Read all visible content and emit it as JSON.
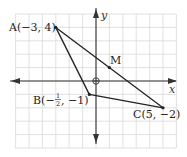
{
  "diagram": {
    "grid": {
      "xmin": -6,
      "xmax": 6,
      "ymin": -5,
      "ymax": 5,
      "unit_px": 13.4,
      "origin_px": [
        96,
        81
      ],
      "color": "#d9d9d9"
    },
    "axes": {
      "x_label": "x",
      "y_label": "y",
      "color": "#333333"
    },
    "points": [
      {
        "id": "A",
        "x": -3,
        "y": 4,
        "label": "A(−3, 4)"
      },
      {
        "id": "B",
        "x": -0.5,
        "y": -1,
        "label_prefix": "B(−",
        "frac_num": "1",
        "frac_den": "2",
        "label_suffix": ", −1)"
      },
      {
        "id": "C",
        "x": 5,
        "y": -2,
        "label": "C(5, −2)"
      },
      {
        "id": "M",
        "x": 1,
        "y": 1,
        "label": "M"
      }
    ],
    "segments": [
      [
        "A",
        "B"
      ],
      [
        "B",
        "C"
      ],
      [
        "A",
        "C"
      ]
    ]
  }
}
